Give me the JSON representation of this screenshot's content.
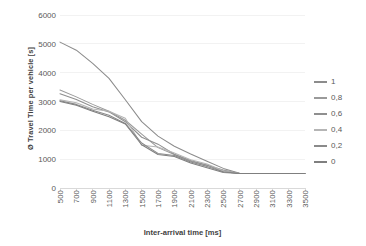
{
  "chart_data": {
    "type": "line",
    "title": "",
    "xlabel": "Inter-arrival time [ms]",
    "ylabel": "Ø Travel Time per vehicle [s]",
    "xlim": [
      500,
      3500
    ],
    "ylim": [
      0,
      6000
    ],
    "ytick_step": 1000,
    "xtick_step": 200,
    "grid": true,
    "legend_position": "right",
    "x": [
      500,
      700,
      900,
      1100,
      1300,
      1500,
      1700,
      1900,
      2100,
      2300,
      2500,
      2700,
      2900,
      3100,
      3300,
      3500
    ],
    "xticklabels": [
      "500",
      "700",
      "900",
      "1100",
      "1300",
      "1500",
      "1700",
      "1900",
      "2100",
      "2300",
      "2500",
      "2700",
      "2900",
      "3100",
      "3300",
      "3500"
    ],
    "yticklabels": [
      "0",
      "1000",
      "2000",
      "3000",
      "4000",
      "5000",
      "6000"
    ],
    "yticks": [
      0,
      1000,
      2000,
      3000,
      4000,
      5000,
      6000
    ],
    "series": [
      {
        "name": "1",
        "color": "#8c8c8c",
        "values": [
          5060,
          4780,
          4320,
          3800,
          3060,
          2300,
          1800,
          1450,
          1180,
          930,
          680,
          510,
          500,
          500,
          500,
          500
        ]
      },
      {
        "name": "0,8",
        "color": "#9a9a9a",
        "values": [
          3400,
          3160,
          2900,
          2660,
          2350,
          1870,
          1400,
          1160,
          930,
          800,
          560,
          500,
          500,
          500,
          500,
          500
        ]
      },
      {
        "name": "0,6",
        "color": "#8f8f8f",
        "values": [
          3270,
          3070,
          2820,
          2640,
          2300,
          1760,
          1520,
          1170,
          950,
          790,
          620,
          505,
          500,
          500,
          500,
          500
        ]
      },
      {
        "name": "0,4",
        "color": "#b5b5b5",
        "values": [
          3060,
          2960,
          2740,
          2660,
          2420,
          1480,
          1420,
          1210,
          980,
          830,
          600,
          500,
          500,
          500,
          500,
          500
        ]
      },
      {
        "name": "0,2",
        "color": "#8a8a8a",
        "values": [
          3030,
          2900,
          2700,
          2520,
          2240,
          1560,
          1200,
          1130,
          900,
          750,
          560,
          500,
          500,
          500,
          500,
          500
        ]
      },
      {
        "name": "0",
        "color": "#7f7f7f",
        "values": [
          3000,
          2870,
          2660,
          2470,
          2220,
          1500,
          1160,
          1090,
          870,
          700,
          540,
          500,
          500,
          500,
          500,
          500
        ]
      }
    ]
  }
}
